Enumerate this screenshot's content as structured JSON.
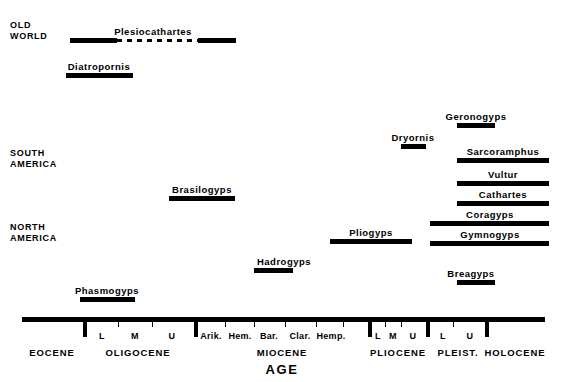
{
  "figure": {
    "axis_title": "AGE"
  },
  "regions": [
    {
      "name": "old-world",
      "text": "OLD\nWORLD",
      "x": 10,
      "y": 20
    },
    {
      "name": "south-america",
      "text": "SOUTH\nAMERICA",
      "x": 10,
      "y": 148
    },
    {
      "name": "north-america",
      "text": "NORTH\nAMERICA",
      "x": 10,
      "y": 222
    }
  ],
  "taxa": [
    {
      "name": "Plesiocathartes",
      "x1": 70,
      "x2": 236,
      "y": 38,
      "label_x": 153,
      "segments": [
        [
          70,
          117
        ],
        [
          198,
          236
        ]
      ],
      "dashed": [
        [
          117,
          198
        ]
      ]
    },
    {
      "name": "Diatropornis",
      "x1": 66,
      "x2": 133,
      "y": 73,
      "label_x": 99,
      "segments": [
        [
          66,
          133
        ]
      ],
      "dashed": []
    },
    {
      "name": "Geronogyps",
      "x1": 457,
      "x2": 495,
      "y": 123,
      "label_x": 476,
      "segments": [
        [
          457,
          495
        ]
      ],
      "dashed": []
    },
    {
      "name": "Dryornis",
      "x1": 401,
      "x2": 426,
      "y": 144,
      "label_x": 413,
      "segments": [
        [
          401,
          426
        ]
      ],
      "dashed": []
    },
    {
      "name": "Sarcoramphus",
      "x1": 457,
      "x2": 549,
      "y": 158,
      "label_x": 503,
      "segments": [
        [
          457,
          549
        ]
      ],
      "dashed": []
    },
    {
      "name": "Vultur",
      "x1": 457,
      "x2": 549,
      "y": 181,
      "label_x": 503,
      "segments": [
        [
          457,
          549
        ]
      ],
      "dashed": []
    },
    {
      "name": "Brasilogyps",
      "x1": 169,
      "x2": 235,
      "y": 196,
      "label_x": 202,
      "segments": [
        [
          169,
          235
        ]
      ],
      "dashed": []
    },
    {
      "name": "Cathartes",
      "x1": 457,
      "x2": 549,
      "y": 201,
      "label_x": 503,
      "segments": [
        [
          457,
          549
        ]
      ],
      "dashed": []
    },
    {
      "name": "Coragyps",
      "x1": 430,
      "x2": 549,
      "y": 221,
      "label_x": 490,
      "segments": [
        [
          430,
          549
        ]
      ],
      "dashed": []
    },
    {
      "name": "Pliogyps",
      "x1": 330,
      "x2": 412,
      "y": 239,
      "label_x": 371,
      "segments": [
        [
          330,
          412
        ]
      ],
      "dashed": []
    },
    {
      "name": "Gymnogyps",
      "x1": 430,
      "x2": 549,
      "y": 241,
      "label_x": 490,
      "segments": [
        [
          430,
          549
        ]
      ],
      "dashed": []
    },
    {
      "name": "Hadrogyps",
      "x1": 254,
      "x2": 293,
      "y": 268,
      "label_x": 284,
      "segments": [
        [
          254,
          293
        ]
      ],
      "dashed": []
    },
    {
      "name": "Breagyps",
      "x1": 457,
      "x2": 495,
      "y": 280,
      "label_x": 471,
      "segments": [
        [
          457,
          495
        ]
      ],
      "dashed": []
    },
    {
      "name": "Phasmogyps",
      "x1": 80,
      "x2": 135,
      "y": 297,
      "label_x": 107,
      "segments": [
        [
          80,
          135
        ]
      ],
      "dashed": []
    }
  ],
  "axis": {
    "line_x1": 22,
    "line_x2": 545,
    "line_y": 317,
    "major_ticks": [
      85,
      196,
      370,
      428,
      487
    ],
    "minor_ticks": [
      118,
      152,
      225,
      254,
      285,
      316,
      343,
      385,
      401,
      453
    ],
    "sub_stages": [
      {
        "label": "L",
        "x": 102
      },
      {
        "label": "M",
        "x": 135
      },
      {
        "label": "U",
        "x": 172
      },
      {
        "label": "Arik.",
        "x": 211
      },
      {
        "label": "Hem.",
        "x": 240
      },
      {
        "label": "Bar.",
        "x": 269
      },
      {
        "label": "Clar.",
        "x": 300
      },
      {
        "label": "Hemp.",
        "x": 331
      },
      {
        "label": "L",
        "x": 378
      },
      {
        "label": "M",
        "x": 393
      },
      {
        "label": "U",
        "x": 413
      },
      {
        "label": "L",
        "x": 443
      },
      {
        "label": "U",
        "x": 470
      }
    ],
    "epochs": [
      {
        "label": "EOCENE",
        "x": 52
      },
      {
        "label": "OLIGOCENE",
        "x": 138
      },
      {
        "label": "MIOCENE",
        "x": 282
      },
      {
        "label": "PLIOCENE",
        "x": 398
      },
      {
        "label": "PLEIST.",
        "x": 458
      },
      {
        "label": "HOLOCENE",
        "x": 515
      }
    ],
    "sub_label_y": 331,
    "epoch_label_y": 347,
    "title_x": 282,
    "title_y": 362
  }
}
